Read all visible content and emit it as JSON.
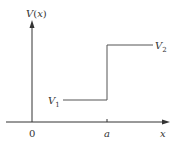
{
  "diagram": {
    "type": "step-potential",
    "y_axis_label": "V(x)",
    "y_axis_label_main": "V",
    "y_axis_label_arg": "(x)",
    "x_axis_label": "x",
    "origin_label": "0",
    "step_position_label": "a",
    "low_level_label": {
      "base": "V",
      "sub": "1"
    },
    "high_level_label": {
      "base": "V",
      "sub": "2"
    },
    "colors": {
      "axis": "#333333",
      "step_line": "#555555",
      "text": "#333333",
      "background": "#ffffff"
    }
  }
}
